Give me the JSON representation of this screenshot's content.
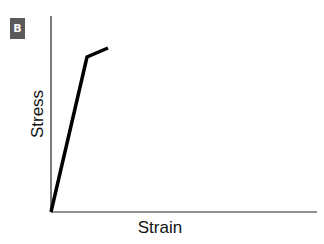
{
  "panel_label": "B",
  "chart_data": {
    "type": "line",
    "title": "",
    "xlabel": "Strain",
    "ylabel": "Stress",
    "grid": false,
    "legend": null,
    "ticks": {
      "x": [],
      "y": []
    },
    "series": [
      {
        "name": "stress-strain curve",
        "points_px": [
          [
            51,
            212
          ],
          [
            87,
            57
          ],
          [
            108,
            48
          ]
        ],
        "x": [
          0,
          0.135,
          0.215
        ],
        "y": [
          0,
          0.79,
          0.84
        ]
      }
    ],
    "axis_px": {
      "origin": [
        51,
        212
      ],
      "x_end": [
        317,
        212
      ],
      "y_end": [
        51,
        16
      ]
    },
    "xlim": [
      0,
      1
    ],
    "ylim": [
      0,
      1
    ],
    "colors": {
      "line": "#000000",
      "axis": "#222222",
      "badge_bg": "#5a5a5a",
      "badge_fg": "#ffffff"
    }
  }
}
